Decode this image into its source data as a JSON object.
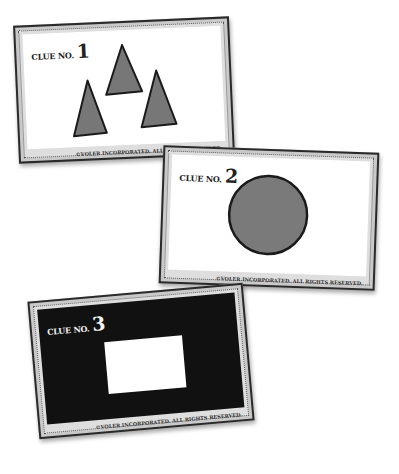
{
  "cards": [
    {
      "label": "CLUE NO.",
      "number": "1",
      "footer": "©VOLER INCORPORATED. ALL RIGHTS RESERVED.",
      "theme": "light",
      "shape": "three-triangles",
      "shape_fill": "#777777",
      "shape_stroke": "#1a1a1a"
    },
    {
      "label": "CLUE NO.",
      "number": "2",
      "footer": "©VOLER INCORPORATED. ALL RIGHTS RESERVED.",
      "theme": "light",
      "shape": "circle",
      "shape_fill": "#7a7a7a",
      "shape_stroke": "#1a1a1a"
    },
    {
      "label": "CLUE NO.",
      "number": "3",
      "footer": "©VOLER INCORPORATED. ALL RIGHTS RESERVED.",
      "theme": "dark",
      "shape": "rectangle",
      "shape_fill": "#ffffff",
      "background": "#111111"
    }
  ]
}
